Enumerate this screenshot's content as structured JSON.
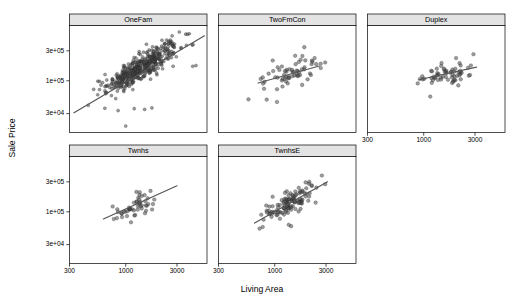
{
  "chart_data": {
    "type": "scatter",
    "title": "",
    "xlabel": "Living Area",
    "ylabel": "Sale Price",
    "xscale": "log",
    "yscale": "log",
    "grid": false,
    "legend": null,
    "xlim": [
      300,
      5700
    ],
    "ylim": [
      15000,
      760000
    ],
    "xticks": [
      300,
      1000,
      3000
    ],
    "xtick_labels": [
      "300",
      "1000",
      "3000"
    ],
    "yticks": [
      30000,
      100000,
      300000
    ],
    "ytick_labels": [
      "3e+04",
      "1e+05",
      "3e+05"
    ],
    "facet_layout": {
      "rows": 2,
      "cols": 3,
      "order": "row-major",
      "empty_cells": [
        [
          1,
          2
        ]
      ]
    },
    "panels": [
      {
        "label": "OneFam",
        "n_points": 460,
        "marker": "open-circle",
        "fit": {
          "type": "linear-loglog",
          "x0": 330,
          "y0": 31000,
          "x1": 5400,
          "y1": 520000
        },
        "cloud": {
          "x_center_log": 3.125,
          "x_spread_log": 0.175,
          "y_center_log": 5.19,
          "resid_spread_log": 0.105,
          "slope": 1.02,
          "outliers": [
            {
              "x": 1000,
              "y": 19000
            },
            {
              "x": 1200,
              "y": 36000
            },
            {
              "x": 640,
              "y": 36500
            },
            {
              "x": 850,
              "y": 33500
            },
            {
              "x": 1500,
              "y": 35000
            },
            {
              "x": 1750,
              "y": 37000
            },
            {
              "x": 4200,
              "y": 170000
            },
            {
              "x": 4500,
              "y": 175000
            },
            {
              "x": 3900,
              "y": 560000
            },
            {
              "x": 3150,
              "y": 600000
            },
            {
              "x": 2700,
              "y": 520000
            }
          ]
        }
      },
      {
        "label": "TwoFmCon",
        "n_points": 62,
        "marker": "open-circle",
        "fit": {
          "type": "linear-loglog",
          "x0": 700,
          "y0": 92000,
          "x1": 2600,
          "y1": 172000
        },
        "cloud": {
          "x_center_log": 3.12,
          "x_spread_log": 0.14,
          "y_center_log": 5.08,
          "resid_spread_log": 0.115,
          "slope": 0.55,
          "outliers": [
            {
              "x": 1050,
              "y": 46000
            },
            {
              "x": 1550,
              "y": 250000
            },
            {
              "x": 2350,
              "y": 230000
            },
            {
              "x": 1800,
              "y": 86000
            }
          ]
        }
      },
      {
        "label": "Duplex",
        "n_points": 60,
        "marker": "open-circle",
        "fit": {
          "type": "linear-loglog",
          "x0": 900,
          "y0": 104000,
          "x1": 3100,
          "y1": 165000
        },
        "cloud": {
          "x_center_log": 3.2,
          "x_spread_log": 0.11,
          "y_center_log": 5.1,
          "resid_spread_log": 0.1,
          "slope": 0.45,
          "outliers": [
            {
              "x": 1150,
              "y": 56000
            },
            {
              "x": 2900,
              "y": 265000
            },
            {
              "x": 2000,
              "y": 230000
            }
          ]
        }
      },
      {
        "label": "Twnhs",
        "n_points": 48,
        "marker": "open-circle",
        "fit": {
          "type": "linear-loglog",
          "x0": 620,
          "y0": 77000,
          "x1": 3000,
          "y1": 260000
        },
        "cloud": {
          "x_center_log": 3.08,
          "x_spread_log": 0.105,
          "y_center_log": 5.09,
          "resid_spread_log": 0.085,
          "slope": 0.78,
          "outliers": [
            {
              "x": 1120,
              "y": 68000
            },
            {
              "x": 1700,
              "y": 215000
            },
            {
              "x": 1350,
              "y": 205000
            }
          ]
        }
      },
      {
        "label": "TwnhsE",
        "n_points": 115,
        "marker": "open-circle",
        "fit": {
          "type": "linear-loglog",
          "x0": 650,
          "y0": 66000,
          "x1": 3100,
          "y1": 300000
        },
        "cloud": {
          "x_center_log": 3.16,
          "x_spread_log": 0.115,
          "y_center_log": 5.16,
          "resid_spread_log": 0.09,
          "slope": 0.9,
          "outliers": [
            {
              "x": 2400,
              "y": 140000
            },
            {
              "x": 2050,
              "y": 150000
            },
            {
              "x": 1350,
              "y": 62000
            },
            {
              "x": 1420,
              "y": 59000
            }
          ]
        }
      }
    ],
    "colors": {
      "point_fill": "#4d4d4d",
      "point_stroke": "#1a1a1a",
      "fit_line": "#555555",
      "strip_background": "#e3e3e3",
      "panel_background": "#ffffff",
      "frame": "#000000"
    }
  }
}
